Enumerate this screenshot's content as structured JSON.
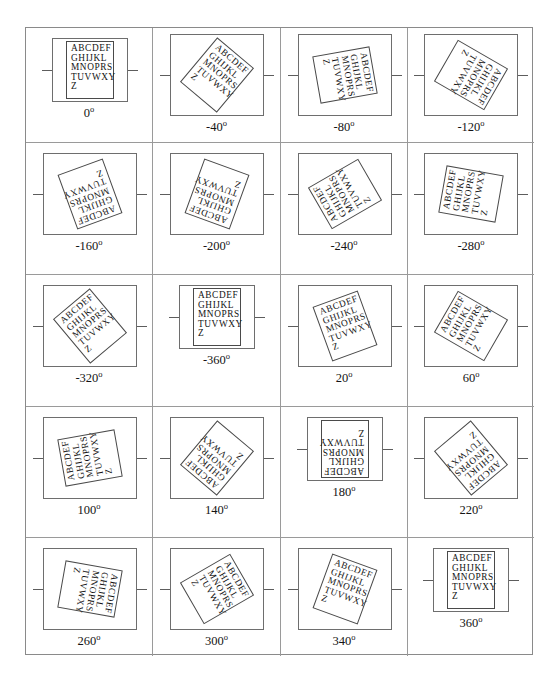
{
  "figure": {
    "alphabet_lines": [
      "ABCDEF",
      "GHIJKL",
      "MNOPRS",
      "TUVWXY",
      "Z"
    ],
    "alphabet_text": "ABCDEF\nGHIJKL\nMNOPRS\nTUVWXY\nZ",
    "degree_symbol": "o",
    "grid": {
      "rows": 5,
      "cols": 4
    },
    "cells": [
      {
        "angle": 0,
        "label": "0",
        "rotation": 0,
        "double_box": true,
        "card_w": 48,
        "card_h": 58
      },
      {
        "angle": -40,
        "label": "-40",
        "rotation": -40,
        "double_box": false,
        "card_w": 48,
        "card_h": 58
      },
      {
        "angle": -80,
        "label": "-80",
        "rotation": -80,
        "double_box": false,
        "card_w": 48,
        "card_h": 58
      },
      {
        "angle": -120,
        "label": "-120",
        "rotation": -120,
        "double_box": false,
        "card_w": 48,
        "card_h": 58
      },
      {
        "angle": -160,
        "label": "-160",
        "rotation": -160,
        "double_box": false,
        "card_w": 48,
        "card_h": 58
      },
      {
        "angle": -200,
        "label": "-200",
        "rotation": -200,
        "double_box": false,
        "card_w": 48,
        "card_h": 58
      },
      {
        "angle": -240,
        "label": "-240",
        "rotation": -240,
        "double_box": false,
        "card_w": 48,
        "card_h": 58
      },
      {
        "angle": -280,
        "label": "-280",
        "rotation": -280,
        "double_box": false,
        "card_w": 48,
        "card_h": 58
      },
      {
        "angle": -320,
        "label": "-320",
        "rotation": -320,
        "double_box": false,
        "card_w": 48,
        "card_h": 58
      },
      {
        "angle": -360,
        "label": "-360",
        "rotation": -360,
        "double_box": true,
        "card_w": 48,
        "card_h": 58
      },
      {
        "angle": 20,
        "label": "20",
        "rotation": 20,
        "double_box": false,
        "card_w": 48,
        "card_h": 58
      },
      {
        "angle": 60,
        "label": "60",
        "rotation": 60,
        "double_box": false,
        "card_w": 48,
        "card_h": 58
      },
      {
        "angle": 100,
        "label": "100",
        "rotation": 100,
        "double_box": false,
        "card_w": 48,
        "card_h": 58
      },
      {
        "angle": 140,
        "label": "140",
        "rotation": 140,
        "double_box": false,
        "card_w": 48,
        "card_h": 58
      },
      {
        "angle": 180,
        "label": "180",
        "rotation": 180,
        "double_box": true,
        "card_w": 48,
        "card_h": 58
      },
      {
        "angle": 220,
        "label": "220",
        "rotation": 220,
        "double_box": false,
        "card_w": 48,
        "card_h": 58
      },
      {
        "angle": 260,
        "label": "260",
        "rotation": 260,
        "double_box": false,
        "card_w": 48,
        "card_h": 58
      },
      {
        "angle": 300,
        "label": "300",
        "rotation": 300,
        "double_box": false,
        "card_w": 48,
        "card_h": 58
      },
      {
        "angle": 340,
        "label": "340",
        "rotation": 340,
        "double_box": false,
        "card_w": 48,
        "card_h": 58
      },
      {
        "angle": 360,
        "label": "360",
        "rotation": 360,
        "double_box": true,
        "card_w": 48,
        "card_h": 58
      }
    ]
  },
  "chart_data": {
    "type": "table",
    "title": "",
    "categories": [
      "0",
      "-40",
      "-80",
      "-120",
      "-160",
      "-200",
      "-240",
      "-280",
      "-320",
      "-360",
      "20",
      "60",
      "100",
      "140",
      "180",
      "220",
      "260",
      "300",
      "340",
      "360"
    ],
    "values": [
      0,
      -40,
      -80,
      -120,
      -160,
      -200,
      -240,
      -280,
      -320,
      -360,
      20,
      60,
      100,
      140,
      180,
      220,
      260,
      300,
      340,
      360
    ],
    "xlabel": "",
    "ylabel": "rotation angle (degrees)",
    "legend": [],
    "grid_on": true
  }
}
